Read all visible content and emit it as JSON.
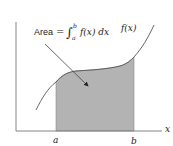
{
  "diagram": {
    "area_label_prefix": "Area",
    "equals": "=",
    "integral_sign": "∫",
    "upper_limit": "b",
    "lower_limit": "a",
    "integrand": "f(x) dx",
    "curve_label": "f(x)",
    "x_axis_label": "x",
    "a_label": "a",
    "b_label": "b",
    "colors": {
      "shade": "#b3b3b3",
      "curve": "#555555",
      "axis": "#777777",
      "text": "#222222"
    }
  }
}
